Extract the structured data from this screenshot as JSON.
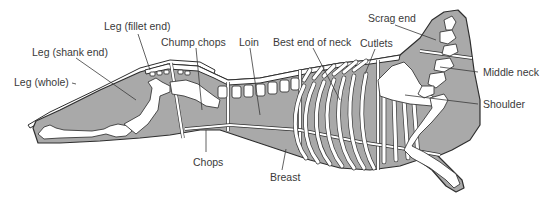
{
  "diagram": {
    "colors": {
      "meat": "#a9a9a9",
      "outline": "#2e2e2e",
      "bone": "#ffffff",
      "label": "#3a3a3a"
    },
    "labels": {
      "leg_fillet_end": "Leg (fillet end)",
      "leg_shank_end": "Leg (shank end)",
      "leg_whole": "Leg (whole)",
      "chump_chops": "Chump chops",
      "loin": "Loin",
      "best_end_of_neck": "Best end of neck",
      "cutlets": "Cutlets",
      "scrag_end": "Scrag end",
      "middle_neck": "Middle neck",
      "shoulder": "Shoulder",
      "chops": "Chops",
      "breast": "Breast"
    }
  }
}
